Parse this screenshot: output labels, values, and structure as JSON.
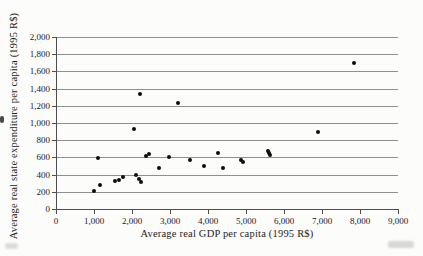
{
  "chart_data": {
    "type": "scatter",
    "title": "",
    "xlabel": "Average real GDP per capita (1995 R$)",
    "ylabel": "Average real state expenditure per capita (1995 R$)",
    "xlim": [
      0,
      9000
    ],
    "xstep": 1000,
    "ylim": [
      0,
      2000
    ],
    "ystep": 200,
    "grid": "horizontal-only",
    "legend": "none",
    "marker": {
      "shape": "dot",
      "color": "#0d0d0d"
    },
    "points": [
      [
        1000,
        210
      ],
      [
        1100,
        590
      ],
      [
        1150,
        280
      ],
      [
        1550,
        330
      ],
      [
        1650,
        340
      ],
      [
        1750,
        375
      ],
      [
        2050,
        930
      ],
      [
        2100,
        390
      ],
      [
        2180,
        350
      ],
      [
        2230,
        310
      ],
      [
        2200,
        1340
      ],
      [
        2370,
        620
      ],
      [
        2450,
        640
      ],
      [
        2700,
        480
      ],
      [
        2980,
        610
      ],
      [
        3200,
        1230
      ],
      [
        3530,
        575
      ],
      [
        3900,
        500
      ],
      [
        4250,
        655
      ],
      [
        4400,
        475
      ],
      [
        4860,
        570
      ],
      [
        4930,
        550
      ],
      [
        5570,
        680
      ],
      [
        5600,
        650
      ],
      [
        5620,
        625
      ],
      [
        6900,
        890
      ],
      [
        7850,
        1700
      ]
    ]
  }
}
